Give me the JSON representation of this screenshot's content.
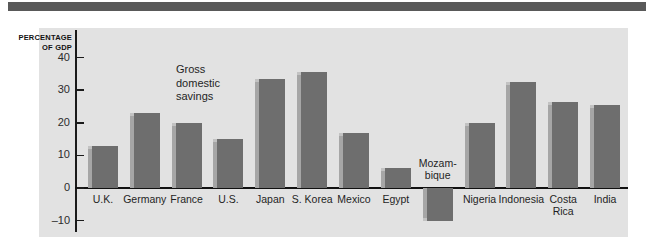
{
  "figure": {
    "background_color": "#ffffff",
    "panel_color": "#e2e2e2",
    "rule_color": "#595959",
    "bar_color": "#6e6e6e",
    "bar_highlight_color": "#a6a6a6",
    "axis_color": "#111111"
  },
  "chart_data": {
    "type": "bar",
    "title": "",
    "annotation": "Gross\ndomestic\nsavings",
    "ylabel": "PERCENTAGE\nOF GDP",
    "xlabel": "",
    "ylim": [
      -10,
      40
    ],
    "yticks": [
      40,
      30,
      20,
      10,
      0,
      -10
    ],
    "ytick_labels": [
      "40",
      "30",
      "20",
      "10",
      "0",
      "–10"
    ],
    "grid": false,
    "legend": "none",
    "categories": [
      "U.K.",
      "Germany",
      "France",
      "U.S.",
      "Japan",
      "S. Korea",
      "Mexico",
      "Egypt",
      "Mozam-\nbique",
      "Nigeria",
      "Indonesia",
      "Costa\nRica",
      "India"
    ],
    "values": [
      13,
      23,
      20,
      15,
      33.5,
      35.5,
      17,
      6,
      -10,
      20,
      32.5,
      26.5,
      25.5
    ],
    "series": [
      {
        "name": "Gross domestic savings",
        "values": [
          13,
          23,
          20,
          15,
          33.5,
          35.5,
          17,
          6,
          -10,
          20,
          32.5,
          26.5,
          25.5
        ]
      }
    ]
  }
}
